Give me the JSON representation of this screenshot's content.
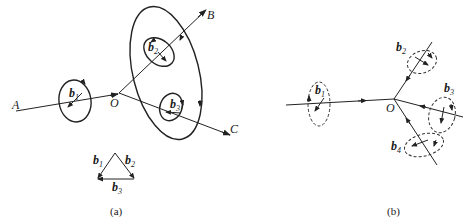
{
  "panel_a": {
    "caption": "(a)",
    "points": {
      "A": "A",
      "O": "O",
      "B": "B",
      "C": "C"
    },
    "burgers": {
      "b1": {
        "main": "b",
        "sub": "1"
      },
      "b2": {
        "main": "b",
        "sub": "2"
      },
      "b3": {
        "main": "b",
        "sub": "3"
      }
    },
    "triangle": {
      "b1": {
        "main": "b",
        "sub": "1"
      },
      "b2": {
        "main": "b",
        "sub": "2"
      },
      "b3": {
        "main": "b",
        "sub": "3"
      }
    }
  },
  "panel_b": {
    "caption": "(b)",
    "points": {
      "O": "O"
    },
    "burgers": {
      "b1": {
        "main": "b",
        "sub": "1"
      },
      "b2": {
        "main": "b",
        "sub": "2"
      },
      "b3": {
        "main": "b",
        "sub": "3"
      },
      "b4": {
        "main": "b",
        "sub": "4"
      }
    }
  }
}
